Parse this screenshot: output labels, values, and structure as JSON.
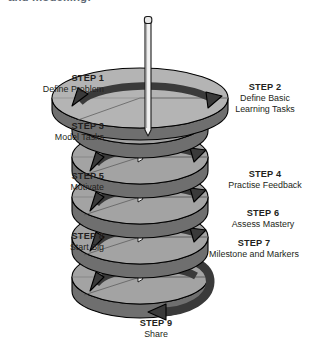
{
  "heading": {
    "clipped_text": "and modelling:"
  },
  "diagram": {
    "colors": {
      "disc_top": "#a3a3a3",
      "disc_top_light": "#b4b4b4",
      "disc_side": "#6f6f6f",
      "disc_side_dark": "#5a5a5a",
      "arrow": "#3a3a3a",
      "outline": "#000000",
      "spindle": "#f2f2f2",
      "spindle_edge": "#1a1a1a",
      "text": "#231f20",
      "heading_text": "#3d4a57",
      "background": "#ffffff"
    },
    "spindle": {
      "name": "central-spindle",
      "cap": "rounded-cap"
    },
    "turns": 5,
    "arrow_count": 6
  },
  "steps": [
    {
      "id": "step-1",
      "head": "STEP 1",
      "desc": "Define Problem",
      "align": "right"
    },
    {
      "id": "step-2",
      "head": "STEP 2",
      "desc": "Define Basic\nLearning Tasks",
      "align": "center"
    },
    {
      "id": "step-3",
      "head": "STEP 3",
      "desc": "Model Tasks",
      "align": "right"
    },
    {
      "id": "step-4",
      "head": "STEP 4",
      "desc": "Practise Feedback",
      "align": "center"
    },
    {
      "id": "step-5",
      "head": "STEP 5",
      "desc": "Motivate",
      "align": "right"
    },
    {
      "id": "step-6",
      "head": "STEP 6",
      "desc": "Assess Mastery",
      "align": "center"
    },
    {
      "id": "step-7",
      "head": "STEP 7",
      "desc": "Milestone and Markers",
      "align": "center"
    },
    {
      "id": "step-8",
      "head": "STEP 8",
      "desc": "Start Big",
      "align": "right"
    },
    {
      "id": "step-9",
      "head": "STEP 9",
      "desc": "Share",
      "align": "center"
    }
  ]
}
